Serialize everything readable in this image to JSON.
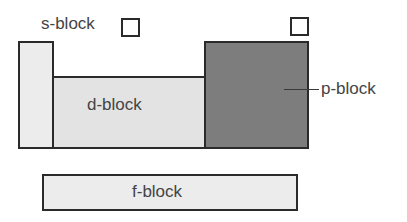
{
  "diagram": {
    "blocks": [
      {
        "id": "s",
        "label": "s-block",
        "fill": "#ececec"
      },
      {
        "id": "d",
        "label": "d-block",
        "fill": "#e3e3e3"
      },
      {
        "id": "p",
        "label": "p-block",
        "fill": "#7d7d7d"
      },
      {
        "id": "f",
        "label": "f-block",
        "fill": "#ececec"
      }
    ],
    "markers": [
      {
        "id": "h-marker",
        "shape": "empty-square"
      },
      {
        "id": "he-marker",
        "shape": "empty-square"
      }
    ]
  }
}
